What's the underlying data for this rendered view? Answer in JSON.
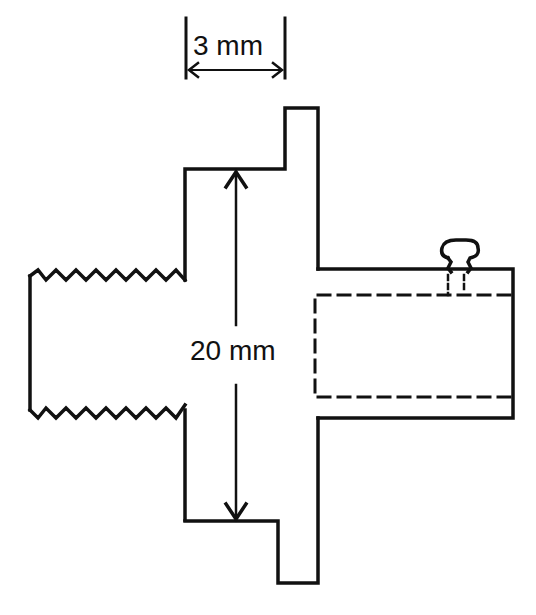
{
  "diagram": {
    "type": "technical-drawing",
    "stroke_color": "#111111",
    "background": "#ffffff",
    "dimensions": {
      "width_label": "3 mm",
      "height_label": "20 mm"
    },
    "parts": [
      {
        "name": "threaded-end",
        "description": "zigzag thread profile on left"
      },
      {
        "name": "hub",
        "description": "central body spanning 20 mm"
      },
      {
        "name": "flange",
        "description": "thin flange, 3 mm thick"
      },
      {
        "name": "tube-socket",
        "description": "right cylindrical socket with dashed inner bore"
      },
      {
        "name": "set-screw",
        "description": "small screw on top of socket"
      }
    ]
  }
}
